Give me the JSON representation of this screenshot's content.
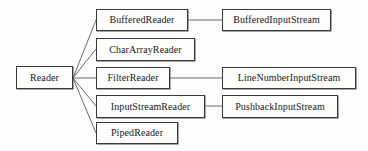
{
  "diagram": {
    "type": "class-hierarchy-tree",
    "orientation": "left-to-right",
    "background_color": "#fdfdfc",
    "line_color": "#5a5a5a",
    "border_color": "#3a3a3a",
    "text_color": "#1a1a1a",
    "root": {
      "id": "reader",
      "label": "Reader",
      "x": 16,
      "y": 66,
      "width": 57,
      "height": 23
    },
    "children": [
      {
        "id": "buffered-reader",
        "label": "BufferedReader",
        "x": 96,
        "y": 9,
        "width": 92,
        "height": 22
      },
      {
        "id": "char-array-reader",
        "label": "CharArrayReader",
        "x": 96,
        "y": 38,
        "width": 99,
        "height": 23
      },
      {
        "id": "filter-reader",
        "label": "FilterReader",
        "x": 96,
        "y": 67,
        "width": 74,
        "height": 22
      },
      {
        "id": "input-stream-reader",
        "label": "InputStreamReader",
        "x": 96,
        "y": 95,
        "width": 109,
        "height": 23
      },
      {
        "id": "piped-reader",
        "label": "PipedReader",
        "x": 96,
        "y": 122,
        "width": 82,
        "height": 22
      }
    ],
    "related": [
      {
        "id": "buffered-input-stream",
        "label": "BufferedInputStream",
        "x": 222,
        "y": 9,
        "width": 109,
        "height": 22
      },
      {
        "id": "line-number-input-stream",
        "label": "LineNumberInputStream",
        "x": 222,
        "y": 67,
        "width": 134,
        "height": 22
      },
      {
        "id": "pushback-input-stream",
        "label": "PushbackInputStream",
        "x": 222,
        "y": 95,
        "width": 116,
        "height": 23
      }
    ],
    "edges": [
      {
        "id": "edge-reader-buffered-reader",
        "from": "reader",
        "to": "buffered-reader",
        "x1": 73,
        "y1": 78,
        "x2": 96,
        "y2": 20
      },
      {
        "id": "edge-reader-char-array-reader",
        "from": "reader",
        "to": "char-array-reader",
        "x1": 73,
        "y1": 78,
        "x2": 96,
        "y2": 49
      },
      {
        "id": "edge-reader-filter-reader",
        "from": "reader",
        "to": "filter-reader",
        "x1": 73,
        "y1": 78,
        "x2": 96,
        "y2": 78
      },
      {
        "id": "edge-reader-input-stream-reader",
        "from": "reader",
        "to": "input-stream-reader",
        "x1": 73,
        "y1": 78,
        "x2": 96,
        "y2": 106
      },
      {
        "id": "edge-reader-piped-reader",
        "from": "reader",
        "to": "piped-reader",
        "x1": 73,
        "y1": 78,
        "x2": 96,
        "y2": 133
      },
      {
        "id": "edge-buffered-reader-buffered-input-stream",
        "from": "buffered-reader",
        "to": "buffered-input-stream",
        "x1": 188,
        "y1": 20,
        "x2": 222,
        "y2": 20
      },
      {
        "id": "edge-filter-reader-line-number-input-stream",
        "from": "filter-reader",
        "to": "line-number-input-stream",
        "x1": 170,
        "y1": 78,
        "x2": 222,
        "y2": 78
      },
      {
        "id": "edge-input-stream-reader-pushback-input-stream",
        "from": "input-stream-reader",
        "to": "pushback-input-stream",
        "x1": 205,
        "y1": 106,
        "x2": 222,
        "y2": 106
      }
    ]
  }
}
